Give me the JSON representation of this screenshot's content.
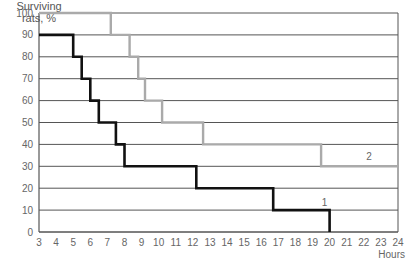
{
  "chart_data": {
    "type": "line",
    "subtype": "step",
    "title": "",
    "ylabel": "Surviving rats, %",
    "xlabel": "Hours",
    "xlim": [
      3,
      24
    ],
    "ylim": [
      0,
      100
    ],
    "xticks": [
      3,
      4,
      5,
      6,
      7,
      8,
      9,
      10,
      11,
      12,
      13,
      14,
      15,
      16,
      17,
      18,
      19,
      20,
      21,
      22,
      23,
      24
    ],
    "yticks": [
      0,
      10,
      20,
      30,
      40,
      50,
      60,
      70,
      80,
      90,
      100
    ],
    "grid": "horizontal",
    "legend": "inline labels",
    "series": [
      {
        "name": "1",
        "color": "#111111",
        "points": [
          [
            3,
            90
          ],
          [
            5,
            90
          ],
          [
            5,
            80
          ],
          [
            5.5,
            80
          ],
          [
            5.5,
            70
          ],
          [
            6,
            70
          ],
          [
            6,
            60
          ],
          [
            6.5,
            60
          ],
          [
            6.5,
            50
          ],
          [
            7.5,
            50
          ],
          [
            7.5,
            40
          ],
          [
            8,
            40
          ],
          [
            8,
            30
          ],
          [
            12.2,
            30
          ],
          [
            12.2,
            20
          ],
          [
            16.7,
            20
          ],
          [
            16.7,
            10
          ],
          [
            20,
            10
          ],
          [
            20,
            0
          ]
        ]
      },
      {
        "name": "2",
        "color": "#aaaaaa",
        "points": [
          [
            3,
            100
          ],
          [
            7.2,
            100
          ],
          [
            7.2,
            90
          ],
          [
            8.3,
            90
          ],
          [
            8.3,
            80
          ],
          [
            8.8,
            80
          ],
          [
            8.8,
            70
          ],
          [
            9.2,
            70
          ],
          [
            9.2,
            60
          ],
          [
            10.2,
            60
          ],
          [
            10.2,
            50
          ],
          [
            12.6,
            50
          ],
          [
            12.6,
            40
          ],
          [
            19.5,
            40
          ],
          [
            19.5,
            30
          ],
          [
            24,
            30
          ]
        ]
      }
    ],
    "annotations": [
      {
        "text": "1",
        "x": 19.7,
        "y": 12
      },
      {
        "text": "2",
        "x": 22.3,
        "y": 33
      }
    ]
  },
  "labels": {
    "y_axis_line1": "Surviving",
    "y_axis_line2": "rats, %",
    "x_axis_unit": "Hours"
  }
}
